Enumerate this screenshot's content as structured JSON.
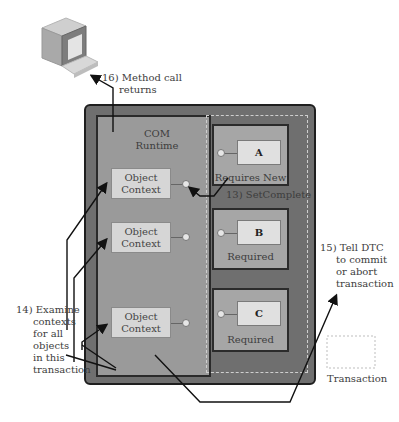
{
  "client": {
    "icon": "computer-terminal-icon"
  },
  "steps": {
    "step16": {
      "line1": "16) Method call",
      "line2": "returns"
    },
    "step13": "13) SetComplete",
    "step14": {
      "lines": [
        "14) Examine",
        "contexts",
        "for all",
        "objects",
        "in this",
        "transaction"
      ]
    },
    "step15": {
      "lines": [
        "15) Tell DTC",
        "to commit",
        "or abort",
        "transaction"
      ]
    }
  },
  "runtime": {
    "line1": "COM",
    "line2": "Runtime"
  },
  "contexts": [
    {
      "line1": "Object",
      "line2": "Context"
    },
    {
      "line1": "Object",
      "line2": "Context"
    },
    {
      "line1": "Object",
      "line2": "Context"
    }
  ],
  "components": [
    {
      "name": "A",
      "attribute": "Requires New"
    },
    {
      "name": "B",
      "attribute": "Required"
    },
    {
      "name": "C",
      "attribute": "Required"
    }
  ],
  "legend": {
    "transaction": "Transaction"
  },
  "colors": {
    "outer": "#6f6f6f",
    "runtime": "#9a9a9a",
    "context": "#d6d6d6",
    "component": "#a6a6a6",
    "object": "#e0e0e0"
  }
}
